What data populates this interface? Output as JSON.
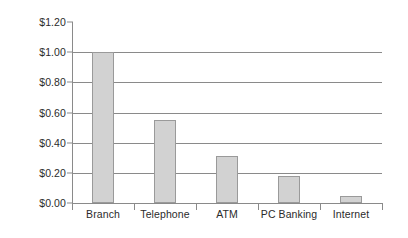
{
  "chart_data": {
    "type": "bar",
    "title": "",
    "subtitle": "",
    "xlabel": "",
    "ylabel": "",
    "categories": [
      "Branch",
      "Telephone",
      "ATM",
      "PC Banking",
      "Internet"
    ],
    "values": [
      1.0,
      0.55,
      0.31,
      0.18,
      0.045
    ],
    "value_labels": [
      "$1.00",
      "$0.55",
      "$0.31",
      "$0.18",
      "$0.05"
    ],
    "ylim": [
      0.0,
      1.2
    ],
    "ytick_values": [
      0.0,
      0.2,
      0.4,
      0.6,
      0.8,
      1.0,
      1.2
    ],
    "ytick_labels": [
      "$0.00",
      "$0.20",
      "$0.40",
      "$0.60",
      "$0.80",
      "$1.00",
      "$1.20"
    ],
    "grid": {
      "horizontal": true,
      "vertical": false,
      "gridline_values": [
        0.2,
        0.4,
        0.6,
        0.8,
        1.0
      ]
    },
    "legend": {
      "visible": false,
      "position": "none",
      "entries": []
    },
    "annotations": [],
    "series": [
      {
        "name": "Cost per transaction",
        "values": [
          1.0,
          0.55,
          0.31,
          0.18,
          0.045
        ]
      }
    ],
    "colors": {
      "bar_fill": "#d2d2d2",
      "bar_border": "#9a9a9a",
      "axis": "#8a8a8a",
      "gridline": "#8a8a8a",
      "text": "#2b2b2b",
      "background": "#ffffff"
    }
  }
}
